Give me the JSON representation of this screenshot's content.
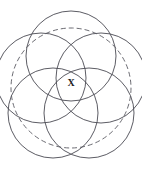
{
  "figure": {
    "kind": "geometry-diagram",
    "caption_label": "X",
    "canvas": {
      "width": 142,
      "height": 172,
      "background": "#ffffff"
    },
    "style": {
      "solid_stroke_color": "#4a4a52",
      "dashed_stroke_color": "#5a5a62",
      "solid_stroke_width": 0.9,
      "dashed_stroke_width": 0.9,
      "dash_pattern": "5,3",
      "label_color": "#1a1a1a"
    },
    "enclosing_circle": {
      "name": "dashed-outer-circle",
      "cx": 71,
      "cy": 88,
      "r": 60,
      "dashed": true
    },
    "circles": [
      {
        "name": "circle-1",
        "cx": 71,
        "cy": 56,
        "r": 45
      },
      {
        "name": "circle-2",
        "cx": 101,
        "cy": 78,
        "r": 45
      },
      {
        "name": "circle-3",
        "cx": 89,
        "cy": 113,
        "r": 45
      },
      {
        "name": "circle-4",
        "cx": 53,
        "cy": 113,
        "r": 45
      },
      {
        "name": "circle-5",
        "cx": 41,
        "cy": 78,
        "r": 45
      }
    ],
    "marked_point": {
      "name": "point-x",
      "label": "X",
      "x": 71,
      "y": 84
    }
  }
}
